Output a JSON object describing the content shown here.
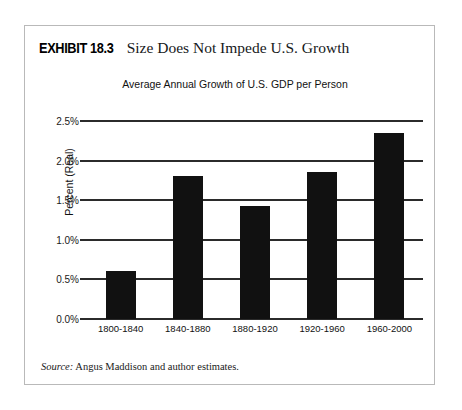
{
  "exhibit": {
    "label": "EXHIBIT 18.3",
    "title": "Size Does Not Impede U.S. Growth",
    "source_label": "Source:",
    "source_text": "Angus Maddison and author estimates."
  },
  "chart_data": {
    "type": "bar",
    "title": "Average Annual Growth of U.S. GDP per Person",
    "xlabel": "",
    "ylabel": "Percent (Real)",
    "categories": [
      "1800-1840",
      "1840-1880",
      "1880-1920",
      "1920-1960",
      "1960-2000"
    ],
    "values": [
      0.6,
      1.8,
      1.43,
      1.85,
      2.35
    ],
    "ylim": [
      0.0,
      2.5
    ],
    "ytick_values": [
      0.0,
      0.5,
      1.0,
      1.5,
      2.0,
      2.5
    ],
    "ytick_labels": [
      "0.0%",
      "0.5%",
      "1.0%",
      "1.5%",
      "2.0%",
      "2.5%"
    ],
    "grid": true,
    "legend": false,
    "bar_color": "#111111",
    "gridline_color": "#2b2b2b"
  }
}
